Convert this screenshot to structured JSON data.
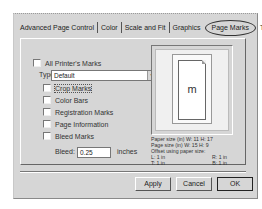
{
  "tabs": [
    {
      "label": "Advanced Page Control",
      "active": false
    },
    {
      "label": "Color",
      "active": false
    },
    {
      "label": "Scale and Fit",
      "active": false
    },
    {
      "label": "Graphics",
      "active": false
    },
    {
      "label": "Page Marks",
      "active": true
    },
    {
      "label": "Trapping",
      "active": false
    }
  ],
  "marks": {
    "all_printers_marks": {
      "label": "All Printer's Marks",
      "checked": false
    },
    "type_label": "Type:",
    "type_value": "Default",
    "items": [
      {
        "label": "Crop Marks",
        "checked": false
      },
      {
        "label": "Color Bars",
        "checked": false
      },
      {
        "label": "Registration Marks",
        "checked": false
      },
      {
        "label": "Page Information",
        "checked": false
      },
      {
        "label": "Bleed Marks",
        "checked": false
      }
    ],
    "bleed_label": "Bleed:",
    "bleed_value": "0.25",
    "bleed_unit": "inches"
  },
  "preview": {
    "glyph": "m",
    "paper_size": "Paper size (in) W: 11 H: 17",
    "page_size": "Page size (in) W: 15 H: 9",
    "offset_label": "Offset using paper size:",
    "offset_l": "L: 1 in",
    "offset_r": "R: 1 in",
    "offset_t": "T: 1 in",
    "offset_b": "B: 1 in"
  },
  "buttons": {
    "apply": "Apply",
    "cancel": "Cancel",
    "ok": "OK"
  }
}
